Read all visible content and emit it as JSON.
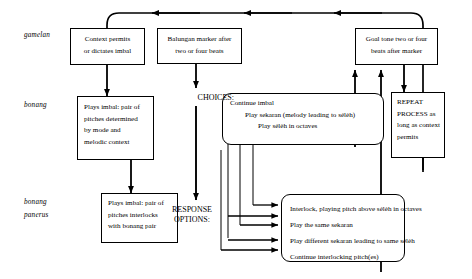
{
  "diagram": {
    "row_labels": [
      {
        "id": "gamelan",
        "text": "gamelan"
      },
      {
        "id": "bonang",
        "text": "bonang"
      },
      {
        "id": "bonang-panerus-1",
        "text": "bonang"
      },
      {
        "id": "bonang-panerus-2",
        "text": "panerus"
      }
    ],
    "nodes": {
      "context_permits": {
        "lines": [
          "Context permits",
          "or dictates imbal"
        ]
      },
      "balungan_marker": {
        "lines": [
          "Balungan marker after",
          "two or four beats"
        ]
      },
      "goal_tone": {
        "lines": [
          "Goal tone two or four",
          "beats after marker"
        ]
      },
      "plays_imbal_bonang": {
        "lines": [
          "Plays imbal: pair of",
          "pitches  determined",
          "by mode and",
          "melodic context"
        ]
      },
      "plays_imbal_panerus": {
        "lines": [
          "Plays imbal: pair of",
          "pitches  interlocks",
          "with bonang pair"
        ]
      },
      "repeat_process": {
        "lines": [
          "REPEAT",
          "PROCESS as",
          "long as context",
          "permits"
        ]
      },
      "continue_imbal": {
        "lines": [
          "Continue imbal",
          "Play sekaran (melody leading to sélèh)",
          "Play sélèh in octaves"
        ]
      },
      "response_options_box": {
        "lines": [
          "Interlock, playing pitch above sélèh in octaves",
          "Play the same sekaran",
          "Play different sekaran leading to same sélèh",
          "Continue interlocking pitch(es)"
        ]
      }
    },
    "labels": {
      "choices": "CHOICES:",
      "response_options": "RESPONSE\nOPTIONS:"
    },
    "colors": {
      "stroke": "#000000",
      "background": "#ffffff"
    }
  }
}
